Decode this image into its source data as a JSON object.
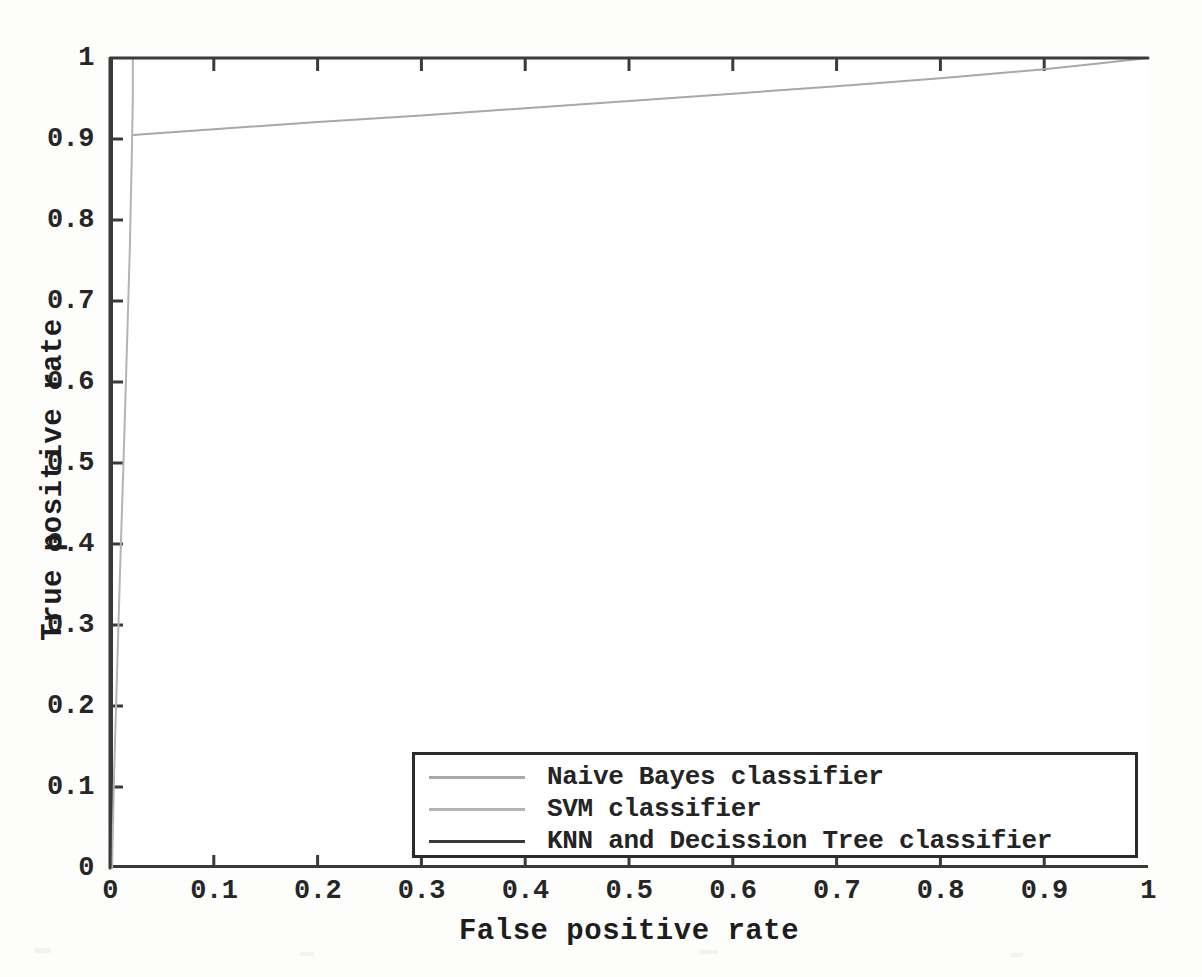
{
  "chart_data": {
    "type": "line",
    "title": "",
    "xlabel": "False positive rate",
    "ylabel": "True positive rate",
    "xlim": [
      0,
      1
    ],
    "ylim": [
      0,
      1
    ],
    "grid": false,
    "legend_position": "lower right",
    "xticks": [
      "0",
      "0.1",
      "0.2",
      "0.3",
      "0.4",
      "0.5",
      "0.6",
      "0.7",
      "0.8",
      "0.9",
      "1"
    ],
    "xtick_values": [
      0,
      0.1,
      0.2,
      0.3,
      0.4,
      0.5,
      0.6,
      0.7,
      0.8,
      0.9,
      1
    ],
    "yticks": [
      "0",
      "0.1",
      "0.2",
      "0.3",
      "0.4",
      "0.5",
      "0.6",
      "0.7",
      "0.8",
      "0.9",
      "1"
    ],
    "ytick_values": [
      0,
      0.1,
      0.2,
      0.3,
      0.4,
      0.5,
      0.6,
      0.7,
      0.8,
      0.9,
      1
    ],
    "series": [
      {
        "name": "Naive Bayes classifier",
        "color": "#a8a8a8",
        "x": [
          0.022,
          0.1,
          0.2,
          0.3,
          0.4,
          0.5,
          0.6,
          0.7,
          0.8,
          0.9,
          0.95,
          1.0
        ],
        "y": [
          0.905,
          0.912,
          0.921,
          0.929,
          0.938,
          0.947,
          0.956,
          0.965,
          0.975,
          0.986,
          0.993,
          1.0
        ]
      },
      {
        "name": "SVM classifier",
        "color": "#b4b4b4",
        "x": [
          0.002,
          0.004,
          0.007,
          0.01,
          0.013,
          0.016,
          0.019,
          0.021,
          0.022,
          0.022
        ],
        "y": [
          0.0,
          0.12,
          0.25,
          0.38,
          0.5,
          0.63,
          0.76,
          0.88,
          0.95,
          1.0
        ]
      },
      {
        "name": "KNN and Decission Tree classifier",
        "color": "#3a3a3a",
        "x": [
          0,
          0,
          1
        ],
        "y": [
          0,
          1,
          1
        ]
      }
    ]
  },
  "axes": {
    "xlabel": "False positive rate",
    "ylabel": "True positive rate",
    "xticks": [
      "0",
      "0.1",
      "0.2",
      "0.3",
      "0.4",
      "0.5",
      "0.6",
      "0.7",
      "0.8",
      "0.9",
      "1"
    ],
    "yticks": [
      "0",
      "0.1",
      "0.2",
      "0.3",
      "0.4",
      "0.5",
      "0.6",
      "0.7",
      "0.8",
      "0.9",
      "1"
    ]
  },
  "legend": {
    "entries": [
      {
        "label": "Naive Bayes classifier",
        "color": "#a8a8a8"
      },
      {
        "label": "SVM classifier",
        "color": "#b4b4b4"
      },
      {
        "label": "KNN and Decission Tree classifier",
        "color": "#3a3a3a"
      }
    ]
  }
}
